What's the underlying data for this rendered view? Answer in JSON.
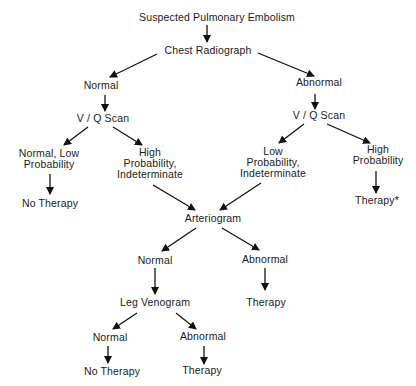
{
  "diagram": {
    "type": "flowchart",
    "title": "Suspected Pulmonary Embolism",
    "nodes": {
      "root": {
        "lines": [
          "Suspected Pulmonary Embolism"
        ],
        "x": 217,
        "y": 12
      },
      "chest": {
        "lines": [
          "Chest Radiograph"
        ],
        "x": 208,
        "y": 45
      },
      "normal1": {
        "lines": [
          "Normal"
        ],
        "x": 101,
        "y": 80
      },
      "abnormal1": {
        "lines": [
          "Abnormal"
        ],
        "x": 319,
        "y": 77
      },
      "vq_left": {
        "lines": [
          "V / Q Scan"
        ],
        "x": 103,
        "y": 113
      },
      "vq_right": {
        "lines": [
          "V / Q Scan"
        ],
        "x": 319,
        "y": 110
      },
      "normal_low": {
        "lines": [
          "Normal, Low",
          "Probability"
        ],
        "x": 49,
        "y": 148
      },
      "high_indet": {
        "lines": [
          "High",
          "Probability,",
          "Indeterminate"
        ],
        "x": 150,
        "y": 147
      },
      "low_indet": {
        "lines": [
          "Low",
          "Probability,",
          "Indeterminate"
        ],
        "x": 273,
        "y": 146
      },
      "high_prob": {
        "lines": [
          "High",
          "Probability"
        ],
        "x": 378,
        "y": 144
      },
      "no_therapy1": {
        "lines": [
          "No Therapy"
        ],
        "x": 50,
        "y": 198
      },
      "therapy_star": {
        "lines": [
          "Therapy*"
        ],
        "x": 377,
        "y": 195
      },
      "arteriogram": {
        "lines": [
          "Arteriogram"
        ],
        "x": 213,
        "y": 213
      },
      "normal2": {
        "lines": [
          "Normal"
        ],
        "x": 155,
        "y": 255
      },
      "abnormal2": {
        "lines": [
          "Abnormal"
        ],
        "x": 265,
        "y": 254
      },
      "leg_venogram": {
        "lines": [
          "Leg Venogram"
        ],
        "x": 155,
        "y": 297
      },
      "therapy2": {
        "lines": [
          "Therapy"
        ],
        "x": 266,
        "y": 297
      },
      "normal3": {
        "lines": [
          "Normal"
        ],
        "x": 110,
        "y": 332
      },
      "abnormal3": {
        "lines": [
          "Abnormal"
        ],
        "x": 203,
        "y": 331
      },
      "no_therapy2": {
        "lines": [
          "No Therapy"
        ],
        "x": 112,
        "y": 366
      },
      "therapy3": {
        "lines": [
          "Therapy"
        ],
        "x": 202,
        "y": 365
      }
    },
    "edges": [
      {
        "from": "root",
        "to": "chest",
        "x1": 207,
        "y1": 25,
        "x2": 207,
        "y2": 42
      },
      {
        "from": "chest",
        "to": "normal1",
        "x1": 157,
        "y1": 54,
        "x2": 110,
        "y2": 77
      },
      {
        "from": "chest",
        "to": "abnormal1",
        "x1": 258,
        "y1": 53,
        "x2": 314,
        "y2": 76
      },
      {
        "from": "normal1",
        "to": "vq_left",
        "x1": 105,
        "y1": 95,
        "x2": 105,
        "y2": 111
      },
      {
        "from": "abnormal1",
        "to": "vq_right",
        "x1": 315,
        "y1": 94,
        "x2": 315,
        "y2": 109
      },
      {
        "from": "vq_left",
        "to": "normal_low",
        "x1": 88,
        "y1": 127,
        "x2": 64,
        "y2": 145
      },
      {
        "from": "vq_left",
        "to": "high_indet",
        "x1": 113,
        "y1": 127,
        "x2": 142,
        "y2": 145
      },
      {
        "from": "vq_right",
        "to": "low_indet",
        "x1": 304,
        "y1": 124,
        "x2": 279,
        "y2": 143
      },
      {
        "from": "vq_right",
        "to": "high_prob",
        "x1": 327,
        "y1": 124,
        "x2": 370,
        "y2": 143
      },
      {
        "from": "normal_low",
        "to": "no_therapy1",
        "x1": 50,
        "y1": 174,
        "x2": 50,
        "y2": 194
      },
      {
        "from": "high_prob",
        "to": "therapy_star",
        "x1": 376,
        "y1": 171,
        "x2": 376,
        "y2": 193
      },
      {
        "from": "high_indet",
        "to": "arteriogram",
        "x1": 153,
        "y1": 185,
        "x2": 195,
        "y2": 210
      },
      {
        "from": "low_indet",
        "to": "arteriogram",
        "x1": 261,
        "y1": 183,
        "x2": 220,
        "y2": 210
      },
      {
        "from": "arteriogram",
        "to": "normal2",
        "x1": 196,
        "y1": 228,
        "x2": 162,
        "y2": 251
      },
      {
        "from": "arteriogram",
        "to": "abnormal2",
        "x1": 222,
        "y1": 228,
        "x2": 259,
        "y2": 250
      },
      {
        "from": "normal2",
        "to": "leg_venogram",
        "x1": 155,
        "y1": 268,
        "x2": 155,
        "y2": 294
      },
      {
        "from": "abnormal2",
        "to": "therapy2",
        "x1": 265,
        "y1": 268,
        "x2": 265,
        "y2": 290
      },
      {
        "from": "leg_venogram",
        "to": "normal3",
        "x1": 137,
        "y1": 313,
        "x2": 113,
        "y2": 329
      },
      {
        "from": "leg_venogram",
        "to": "abnormal3",
        "x1": 176,
        "y1": 313,
        "x2": 196,
        "y2": 329
      },
      {
        "from": "normal3",
        "to": "no_therapy2",
        "x1": 108,
        "y1": 346,
        "x2": 108,
        "y2": 363
      },
      {
        "from": "abnormal3",
        "to": "therapy3",
        "x1": 204,
        "y1": 346,
        "x2": 204,
        "y2": 364
      }
    ],
    "colors": {
      "text": "#1a1a1a",
      "line": "#111111",
      "background": "#ffffff"
    }
  }
}
